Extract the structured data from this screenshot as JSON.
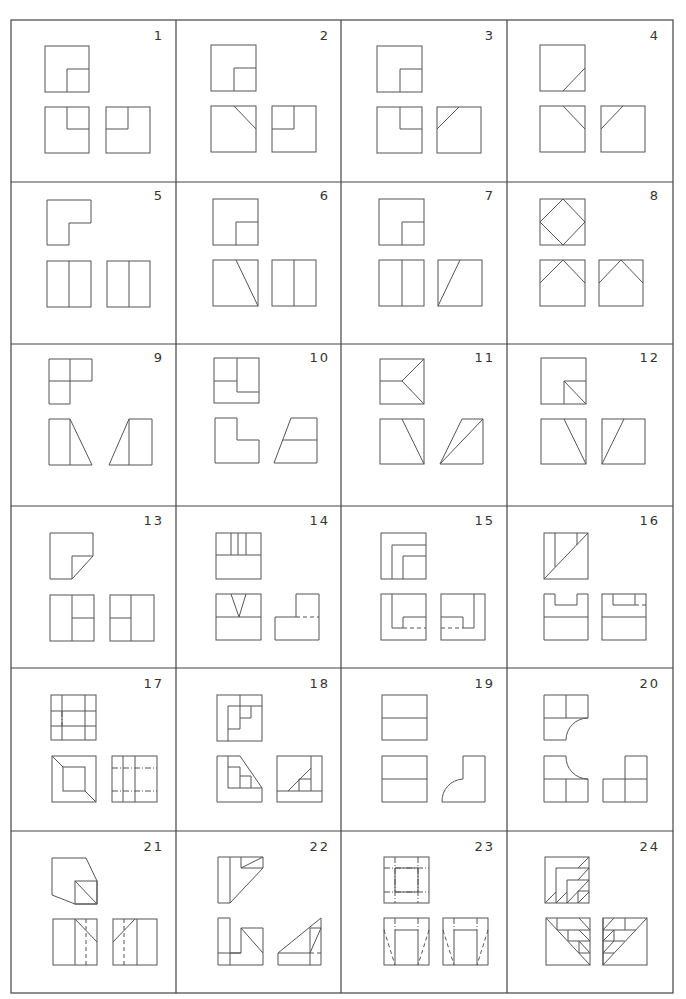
{
  "grid": {
    "rows": 6,
    "cols": 4,
    "x0": 11,
    "y0": 20,
    "x1": 673,
    "y1": 993
  },
  "cells": [
    {
      "num": "1"
    },
    {
      "num": "2"
    },
    {
      "num": "3"
    },
    {
      "num": "4"
    },
    {
      "num": "5"
    },
    {
      "num": "6"
    },
    {
      "num": "7"
    },
    {
      "num": "8"
    },
    {
      "num": "9"
    },
    {
      "num": "10"
    },
    {
      "num": "11"
    },
    {
      "num": "12"
    },
    {
      "num": "13"
    },
    {
      "num": "14"
    },
    {
      "num": "15"
    },
    {
      "num": "16"
    },
    {
      "num": "17"
    },
    {
      "num": "18"
    },
    {
      "num": "19"
    },
    {
      "num": "20"
    },
    {
      "num": "21"
    },
    {
      "num": "22"
    },
    {
      "num": "23"
    },
    {
      "num": "24"
    }
  ],
  "colors": {
    "line": "#555555",
    "grid": "#444444",
    "background": "#ffffff"
  }
}
